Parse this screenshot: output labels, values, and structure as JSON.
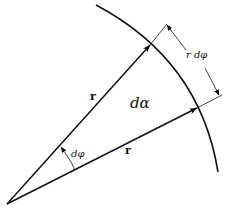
{
  "diagram": {
    "labels": {
      "r_upper": "r",
      "r_lower": "r",
      "area_element": "dα",
      "angle": "dφ",
      "arc_length": "r dφ"
    },
    "colors": {
      "stroke": "#111111",
      "background": "#ffffff"
    }
  }
}
